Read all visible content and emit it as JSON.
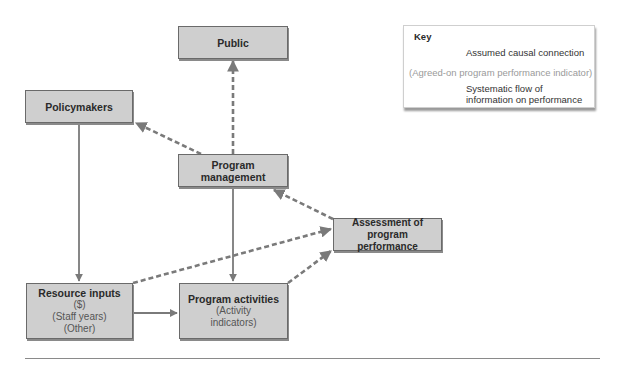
{
  "nodes": {
    "public": {
      "title": "Public"
    },
    "policymakers": {
      "title": "Policymakers"
    },
    "program_management": {
      "title": "Program management"
    },
    "assessment": {
      "title": "Assessment of program performance"
    },
    "resource_inputs": {
      "title": "Resource inputs",
      "lines": [
        "($)",
        "(Staff years)",
        "(Other)"
      ]
    },
    "program_activities": {
      "title": "Program activities",
      "lines": [
        "(Activity",
        "indicators)"
      ]
    }
  },
  "key": {
    "title": "Key",
    "solid_label": "Assumed causal connection",
    "indicator_label": "(Agreed-on program performance indicator)",
    "dashed_label_1": "Systematic flow of",
    "dashed_label_2": "information on performance"
  },
  "edges": [
    {
      "from": "policymakers",
      "to": "resource_inputs",
      "style": "solid"
    },
    {
      "from": "program_management",
      "to": "program_activities",
      "style": "solid"
    },
    {
      "from": "resource_inputs",
      "to": "program_activities",
      "style": "solid"
    },
    {
      "from": "program_management",
      "to": "public",
      "style": "dashed"
    },
    {
      "from": "program_management",
      "to": "policymakers",
      "style": "dashed"
    },
    {
      "from": "assessment",
      "to": "program_management",
      "style": "dashed"
    },
    {
      "from": "resource_inputs",
      "to": "assessment",
      "style": "dashed"
    },
    {
      "from": "program_activities",
      "to": "assessment",
      "style": "dashed"
    }
  ],
  "colors": {
    "box_fill": "#cfcfcf",
    "arrow": "#777777",
    "border": "#6a6a6a"
  }
}
